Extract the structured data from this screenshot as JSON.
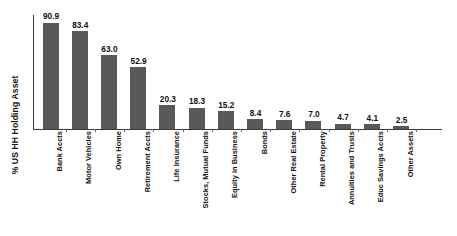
{
  "chart_data": {
    "type": "bar",
    "title": "",
    "xlabel": "",
    "ylabel": "% US HH Holding Asset",
    "ylim": [
      0,
      100
    ],
    "grid": false,
    "legend": null,
    "orientation": "vertical",
    "bar_color": "#595959",
    "axis_color": "#3a3a3a",
    "value_label_format": "one-decimal",
    "categories": [
      "Bank Accts",
      "Motor Vehicles",
      "Own Home",
      "Retirement Accts",
      "Life Insurance",
      "Stocks, Mutual Funds",
      "Equity in Business",
      "Bonds",
      "Other Real Estate",
      "Rental Property",
      "Annuities and Trusts",
      "Educ Savings Accts",
      "Other Assets"
    ],
    "values": [
      90.9,
      83.4,
      63.0,
      52.9,
      20.3,
      18.3,
      15.2,
      8.4,
      7.6,
      7.0,
      4.7,
      4.1,
      2.5
    ],
    "value_labels": [
      "90.9",
      "83.4",
      "63.0",
      "52.9",
      "20.3",
      "18.3",
      "15.2",
      "8.4",
      "7.6",
      "7.0",
      "4.7",
      "4.1",
      "2.5"
    ]
  }
}
